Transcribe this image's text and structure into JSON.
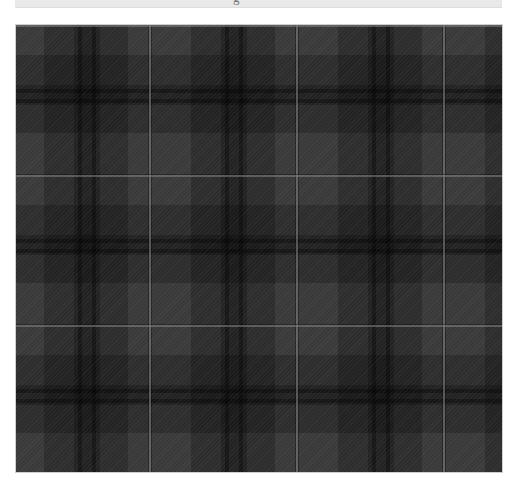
{
  "image": {
    "description": "Dark charcoal/black tartan plaid fabric swatch",
    "top_caption_fragment": "g",
    "colors": {
      "base": "#3a3a3a",
      "medium_band": "#2c2c2c",
      "dark_band": "#1c1c1c",
      "darkest_crossing": "#0e0e0e",
      "overcheck_line": "#5a5a5a",
      "caption_strip": "#e9e9e9",
      "page_background": "#ffffff"
    },
    "pattern": {
      "repeat_px_horizontal": 147,
      "repeat_px_vertical": 150,
      "vertical_overcheck_x": [
        149,
        296,
        442
      ],
      "horizontal_overcheck_y": [
        174,
        324
      ]
    }
  }
}
